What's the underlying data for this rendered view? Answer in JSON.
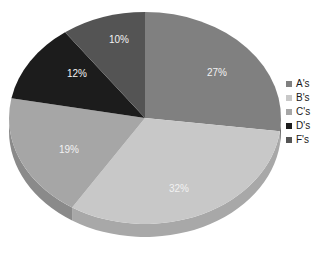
{
  "chart_data": {
    "type": "pie",
    "title": "",
    "xlabel": "",
    "ylabel": "",
    "categories": [
      "A's",
      "B's",
      "C's",
      "D's",
      "F's"
    ],
    "values": [
      27,
      32,
      19,
      12,
      10
    ],
    "value_labels": [
      "27%",
      "32%",
      "19%",
      "12%",
      "10%"
    ],
    "units": "percent",
    "three_d": true,
    "start_angle_deg": 0,
    "direction": "clockwise",
    "legend_position": "right",
    "grid": false,
    "slices": [
      {
        "label": "A's",
        "value": 27,
        "value_label": "27%",
        "color": "#808080",
        "side_color": "#6b6b6b",
        "label_x": 217,
        "label_y": 73
      },
      {
        "label": "B's",
        "value": 32,
        "value_label": "32%",
        "color": "#c8c8c8",
        "side_color": "#a8a8a8",
        "label_x": 179,
        "label_y": 189
      },
      {
        "label": "C's",
        "value": 19,
        "value_label": "19%",
        "color": "#a6a6a6",
        "side_color": "#8a8a8a",
        "label_x": 69,
        "label_y": 150
      },
      {
        "label": "D's",
        "value": 12,
        "value_label": "12%",
        "color": "#1c1c1c",
        "side_color": "#141414",
        "label_x": 77,
        "label_y": 74
      },
      {
        "label": "F's",
        "value": 10,
        "value_label": "10%",
        "color": "#545454",
        "side_color": "#454545",
        "label_x": 119,
        "label_y": 40
      }
    ],
    "legend": {
      "entries": [
        {
          "label": "A's",
          "color": "#808080"
        },
        {
          "label": "B's",
          "color": "#c8c8c8"
        },
        {
          "label": "C's",
          "color": "#a6a6a6"
        },
        {
          "label": "D's",
          "color": "#1c1c1c"
        },
        {
          "label": "F's",
          "color": "#545454"
        }
      ]
    },
    "geometry": {
      "center_x": 145,
      "center_y": 118,
      "radius_x": 136,
      "radius_y": 106,
      "depth": 13
    },
    "background_color": "#ffffff"
  }
}
